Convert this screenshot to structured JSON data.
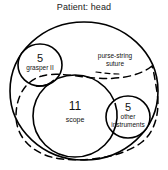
{
  "diagram": {
    "title": "Patient: head",
    "type": "venn-euler-set-diagram",
    "outer_set": {
      "name": "patient-head-boundary",
      "shape": "circle",
      "label": ""
    },
    "annotations": [
      {
        "name": "purse-string-suture",
        "line1": "purse-string",
        "line2": "suture",
        "style": "dashed",
        "color": "#000000"
      }
    ],
    "sets": [
      {
        "name": "grasper-ii",
        "count": "5",
        "label": "grasper II",
        "position": "upper-left"
      },
      {
        "name": "scope",
        "count": "11",
        "label": "scope",
        "position": "center-lower-left"
      },
      {
        "name": "other-instruments",
        "count": "5",
        "label_line1": "other",
        "label_line2": "instruments",
        "position": "lower-right"
      }
    ],
    "colors": {
      "stroke": "#000000",
      "background": "#ffffff",
      "text": "#111111"
    }
  }
}
